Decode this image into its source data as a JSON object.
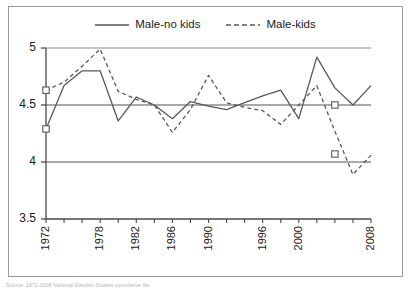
{
  "figure": {
    "source_note": "Source: 1972-2008 National Election Studies cumulative file"
  },
  "legend": {
    "position": "top-center",
    "entries": [
      {
        "label": "Male-no kids",
        "style": "solid",
        "color": "#595959"
      },
      {
        "label": "Male-kids",
        "style": "dashed",
        "color": "#595959"
      }
    ]
  },
  "axes": {
    "y_ticks": [
      "3.5",
      "4",
      "4.5",
      "5"
    ],
    "x_ticks": [
      "1972",
      "1978",
      "1982",
      "1986",
      "1990",
      "1996",
      "2000",
      "2008"
    ]
  },
  "chart_data": {
    "type": "line",
    "title": "",
    "subtitle": "",
    "xlabel": "",
    "ylabel": "",
    "ylim": [
      3.5,
      5
    ],
    "xlim": [
      1972,
      2008
    ],
    "grid": true,
    "gridlines_y": [
      4,
      4.5
    ],
    "legend_position": "top-center",
    "x": [
      1972,
      1974,
      1976,
      1978,
      1980,
      1982,
      1984,
      1986,
      1988,
      1990,
      1992,
      1994,
      1996,
      1998,
      2000,
      2002,
      2004,
      2006,
      2008
    ],
    "series": [
      {
        "name": "Male-no kids",
        "style": "solid",
        "color": "#595959",
        "marker_points": [
          {
            "x": 1972,
            "y": 4.29
          },
          {
            "x": 2004,
            "y": 4.5
          }
        ],
        "values": [
          4.29,
          4.67,
          4.8,
          4.8,
          4.36,
          4.57,
          4.5,
          4.38,
          4.53,
          4.49,
          4.46,
          4.52,
          4.58,
          4.63,
          4.38,
          4.92,
          4.65,
          4.5,
          4.67
        ]
      },
      {
        "name": "Male-kids",
        "style": "dashed",
        "color": "#595959",
        "marker_points": [
          {
            "x": 1972,
            "y": 4.63
          },
          {
            "x": 2004,
            "y": 4.07
          }
        ],
        "values": [
          4.63,
          4.7,
          4.84,
          4.99,
          4.62,
          4.55,
          4.5,
          4.26,
          4.46,
          4.76,
          4.52,
          4.48,
          4.45,
          4.33,
          4.5,
          4.67,
          4.27,
          3.89,
          4.06
        ]
      }
    ]
  }
}
